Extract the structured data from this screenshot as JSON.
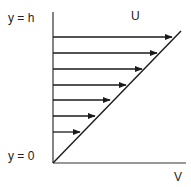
{
  "diagram": {
    "labels": {
      "top_y": "y = h",
      "bottom_y": "y = 0",
      "top_velocity": "U",
      "bottom_axis": "V"
    },
    "colors": {
      "line": "#1a1a1a",
      "axis": "#333333",
      "text": "#222222",
      "background": "#ffffff"
    },
    "geometry": {
      "origin": [
        53,
        163
      ],
      "axis_top": [
        53,
        12
      ],
      "axis_right": [
        186,
        163
      ],
      "diagonal_end": [
        181,
        31
      ]
    },
    "arrows": [
      {
        "y": 37,
        "tip_x": 172
      },
      {
        "y": 53,
        "tip_x": 157
      },
      {
        "y": 69,
        "tip_x": 142
      },
      {
        "y": 85,
        "tip_x": 126
      },
      {
        "y": 100,
        "tip_x": 110
      },
      {
        "y": 116,
        "tip_x": 95
      },
      {
        "y": 132,
        "tip_x": 80
      }
    ]
  }
}
